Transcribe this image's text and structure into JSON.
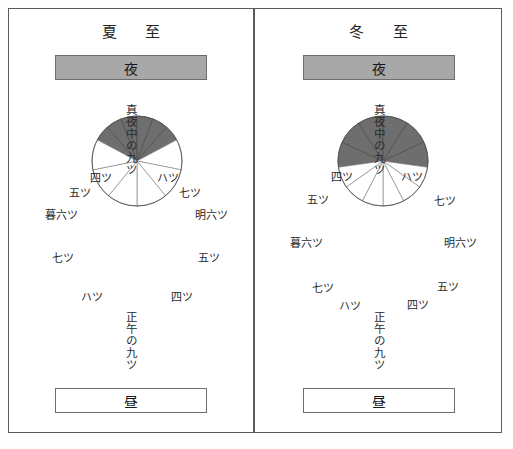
{
  "figure": {
    "background": "#ffffff",
    "frame_color": "#5a5a5a",
    "night_fill": "#6e6e6e",
    "day_fill": "#ffffff",
    "band_night_fill": "#a8a8a8"
  },
  "panels": [
    {
      "id": "summer",
      "title": "夏 至",
      "night_band_label": "夜",
      "day_band_label": "昼",
      "midnight_label": "真夜中の九ツ",
      "noon_label": "正午の九ツ",
      "night_arc_degrees": 124,
      "day_arc_degrees": 236,
      "night_hours": 6,
      "day_hours": 6,
      "labels": [
        {
          "text": "四ツ",
          "x": 101,
          "y": 177
        },
        {
          "text": "ハツ",
          "x": 168,
          "y": 177
        },
        {
          "text": "五ツ",
          "x": 80,
          "y": 192
        },
        {
          "text": "七ツ",
          "x": 190,
          "y": 192
        },
        {
          "text": "暮六ツ",
          "x": 61,
          "y": 214
        },
        {
          "text": "明六ツ",
          "x": 211,
          "y": 214
        },
        {
          "text": "七ツ",
          "x": 63,
          "y": 257
        },
        {
          "text": "五ツ",
          "x": 209,
          "y": 257
        },
        {
          "text": "ハツ",
          "x": 92,
          "y": 296
        },
        {
          "text": "四ツ",
          "x": 182,
          "y": 296
        }
      ]
    },
    {
      "id": "winter",
      "title": "冬 至",
      "night_band_label": "夜",
      "day_band_label": "昼",
      "midnight_label": "真夜中の九ツ",
      "noon_label": "正午の九ツ",
      "night_arc_degrees": 196,
      "day_arc_degrees": 164,
      "night_hours": 6,
      "day_hours": 6,
      "labels": [
        {
          "text": "四ツ",
          "x": 342,
          "y": 176
        },
        {
          "text": "ハツ",
          "x": 412,
          "y": 176
        },
        {
          "text": "五ツ",
          "x": 318,
          "y": 199
        },
        {
          "text": "七ツ",
          "x": 445,
          "y": 200
        },
        {
          "text": "暮六ツ",
          "x": 306,
          "y": 242
        },
        {
          "text": "明六ツ",
          "x": 460,
          "y": 242
        },
        {
          "text": "七ツ",
          "x": 323,
          "y": 287
        },
        {
          "text": "五ツ",
          "x": 448,
          "y": 286
        },
        {
          "text": "ハツ",
          "x": 350,
          "y": 305
        },
        {
          "text": "四ツ",
          "x": 418,
          "y": 304
        }
      ]
    }
  ],
  "chart_data": {
    "type": "pie",
    "legend_position": "top-and-bottom bands",
    "grid": false,
    "charts": [
      {
        "name": "夏至",
        "categories": [
          "夜",
          "昼"
        ],
        "values": [
          124,
          236
        ],
        "unit": "degrees",
        "night_segment_labels": [
          "暮六ツ",
          "五ツ",
          "四ツ",
          "真夜中の九ツ",
          "ハツ",
          "七ツ",
          "明六ツ"
        ],
        "day_segment_labels": [
          "明六ツ",
          "五ツ",
          "四ツ",
          "正午の九ツ",
          "ハツ",
          "七ツ",
          "暮六ツ"
        ],
        "segments_per_half": 6
      },
      {
        "name": "冬至",
        "categories": [
          "夜",
          "昼"
        ],
        "values": [
          196,
          164
        ],
        "unit": "degrees",
        "night_segment_labels": [
          "暮六ツ",
          "五ツ",
          "四ツ",
          "真夜中の九ツ",
          "ハツ",
          "七ツ",
          "明六ツ"
        ],
        "day_segment_labels": [
          "明六ツ",
          "五ツ",
          "四ツ",
          "正午の九ツ",
          "ハツ",
          "七ツ",
          "暮六ツ"
        ],
        "segments_per_half": 6
      }
    ]
  }
}
